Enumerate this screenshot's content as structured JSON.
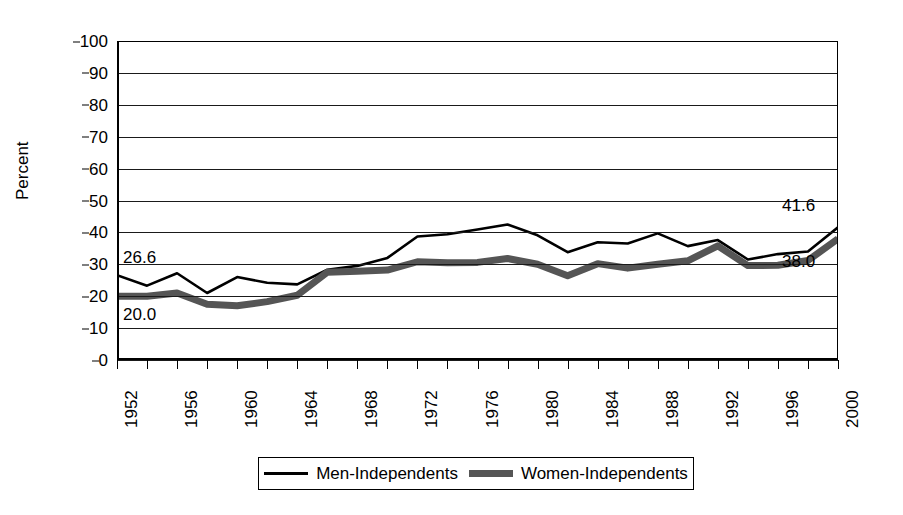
{
  "chart_data": {
    "type": "line",
    "title": "",
    "xlabel": "",
    "ylabel": "Percent",
    "ylim": [
      0,
      100
    ],
    "xlim": [
      1952,
      2000
    ],
    "grid": true,
    "legend_position": "bottom",
    "ytick_labels": [
      "100",
      "90",
      "80",
      "70",
      "60",
      "50",
      "40",
      "30",
      "20",
      "10",
      "0"
    ],
    "ytick_values": [
      100,
      90,
      80,
      70,
      60,
      50,
      40,
      30,
      20,
      10,
      0
    ],
    "xtick_values": [
      1952,
      1954,
      1956,
      1958,
      1960,
      1962,
      1964,
      1966,
      1968,
      1970,
      1972,
      1974,
      1976,
      1978,
      1980,
      1982,
      1984,
      1986,
      1988,
      1990,
      1992,
      1994,
      1996,
      1998,
      2000
    ],
    "xtick_labels": [
      "1952",
      "",
      "1956",
      "",
      "1960",
      "",
      "1964",
      "",
      "1968",
      "",
      "1972",
      "",
      "1976",
      "",
      "1980",
      "",
      "1984",
      "",
      "1988",
      "",
      "1992",
      "",
      "1996",
      "",
      "2000"
    ],
    "x": [
      1952,
      1954,
      1956,
      1958,
      1960,
      1962,
      1964,
      1966,
      1968,
      1970,
      1972,
      1974,
      1976,
      1978,
      1980,
      1982,
      1984,
      1986,
      1988,
      1990,
      1992,
      1994,
      1996,
      1998,
      2000
    ],
    "series": [
      {
        "name": "Men-Independents",
        "color": "#000000",
        "style": "thin-solid",
        "values": [
          26.6,
          23.3,
          27.2,
          21.0,
          26.0,
          24.2,
          23.7,
          28.3,
          29.5,
          32.0,
          38.7,
          39.4,
          40.9,
          42.5,
          39.1,
          33.8,
          36.9,
          36.5,
          39.7,
          35.7,
          37.6,
          31.5,
          33.2,
          34.0,
          41.6
        ]
      },
      {
        "name": "Women-Independents",
        "color": "#555555",
        "style": "thick-solid",
        "values": [
          20.0,
          20.0,
          21.0,
          17.5,
          17.0,
          18.3,
          20.3,
          27.5,
          27.8,
          28.2,
          30.8,
          30.5,
          30.6,
          31.8,
          30.0,
          26.4,
          30.2,
          28.8,
          30.0,
          31.1,
          35.8,
          29.6,
          29.7,
          31.2,
          38.0
        ]
      }
    ],
    "annotations": [
      {
        "text": "26.6",
        "series": "Men-Independents",
        "at_x": 1952,
        "position": "upper-left"
      },
      {
        "text": "20.0",
        "series": "Women-Independents",
        "at_x": 1952,
        "position": "lower-left"
      },
      {
        "text": "41.6",
        "series": "Men-Independents",
        "at_x": 2000,
        "position": "upper-right"
      },
      {
        "text": "38.0",
        "series": "Women-Independents",
        "at_x": 2000,
        "position": "lower-right"
      }
    ]
  }
}
